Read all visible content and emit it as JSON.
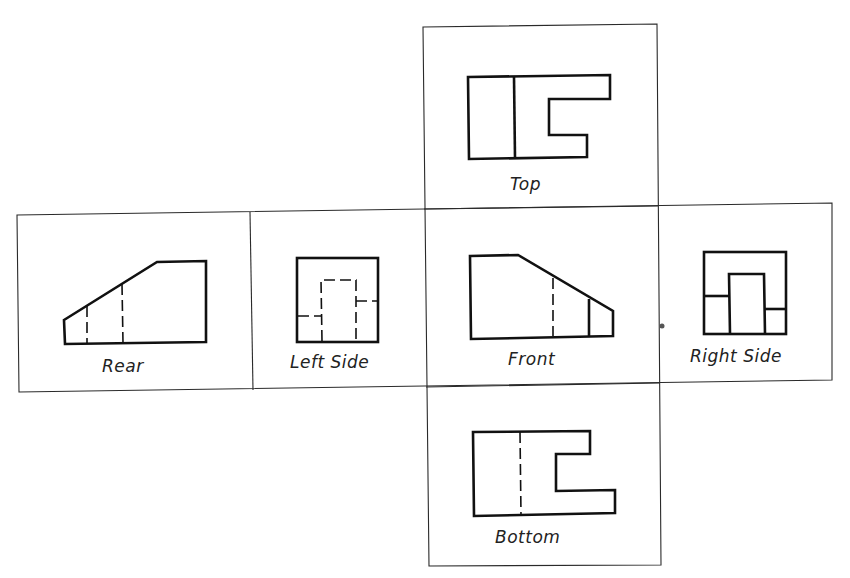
{
  "diagram": {
    "type": "orthographic-projection-layout",
    "views": [
      {
        "id": "top",
        "label": "Top"
      },
      {
        "id": "rear",
        "label": "Rear"
      },
      {
        "id": "left_side",
        "label": "Left Side"
      },
      {
        "id": "front",
        "label": "Front"
      },
      {
        "id": "right_side",
        "label": "Right Side"
      },
      {
        "id": "bottom",
        "label": "Bottom"
      }
    ]
  },
  "colors": {
    "line": "#111111",
    "frame": "#2a2a2a",
    "background": "#ffffff"
  }
}
